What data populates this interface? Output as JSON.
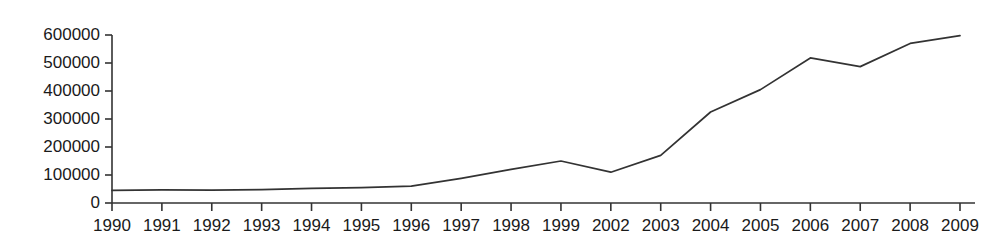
{
  "chart_data": {
    "type": "line",
    "title": "",
    "subtitle": "",
    "xlabel": "",
    "ylabel": "",
    "categories": [
      "1990",
      "1991",
      "1992",
      "1993",
      "1994",
      "1995",
      "1996",
      "1997",
      "1998",
      "1999",
      "2002",
      "2003",
      "2004",
      "2005",
      "2006",
      "2007",
      "2008",
      "2009"
    ],
    "values": [
      45000,
      47000,
      46000,
      48000,
      52000,
      55000,
      60000,
      88000,
      120000,
      150000,
      110000,
      170000,
      325000,
      405000,
      518000,
      487000,
      570000,
      598000
    ],
    "series": [
      {
        "name": "",
        "values": [
          45000,
          47000,
          46000,
          48000,
          52000,
          55000,
          60000,
          88000,
          120000,
          150000,
          110000,
          170000,
          325000,
          405000,
          518000,
          487000,
          570000,
          598000
        ]
      }
    ],
    "ylim": [
      0,
      600000
    ],
    "yticks": [
      0,
      100000,
      200000,
      300000,
      400000,
      500000,
      600000
    ],
    "ytick_labels": [
      "0",
      "100000",
      "200000",
      "300000",
      "400000",
      "500000",
      "600000"
    ],
    "grid": false,
    "legend": false,
    "legend_position": "none",
    "line_color": "#333333",
    "axis_color": "#333333",
    "background_color": "#ffffff"
  }
}
